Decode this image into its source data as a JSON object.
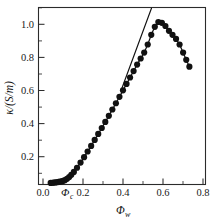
{
  "chart_data": {
    "type": "line",
    "title": "",
    "xlabel": "Φw",
    "ylabel": "κ/(S/m)",
    "xlabel_main": "Φ",
    "xlabel_subscript": "w",
    "ylabel_text": "κ/(S/m)",
    "xlim": [
      0.0,
      0.85
    ],
    "ylim": [
      0.0,
      1.1
    ],
    "x_ticks": [
      0.0,
      0.2,
      0.4,
      0.6,
      0.8
    ],
    "x_tick_labels": [
      "0.0",
      "0.2",
      "0.4",
      "0.6",
      "0.8"
    ],
    "y_ticks": [
      0.2,
      0.4,
      0.6,
      0.8,
      1.0
    ],
    "y_tick_labels": [
      "0.2",
      "0.4",
      "0.6",
      "0.8",
      "1.0"
    ],
    "x_minor_ticks": [
      0.1,
      0.3,
      0.5,
      0.7
    ],
    "y_minor_ticks": [
      0.1,
      0.3,
      0.5,
      0.7,
      0.9,
      1.1
    ],
    "grid": false,
    "legend": "none",
    "marker": "filled-circle",
    "marker_size": 3.1,
    "line_color": "#111111",
    "marker_color": "#111111",
    "axis_color": "#2b2b2b",
    "background": "#ffffff",
    "annotations": [
      {
        "name": "percolation-threshold",
        "text": "Φc",
        "text_main": "Φ",
        "text_subscript": "c",
        "x": 0.135,
        "y": 0.0,
        "description": "percolation threshold marker on x-axis"
      }
    ],
    "series": [
      {
        "name": "conductivity",
        "x": [
          0.062,
          0.07,
          0.078,
          0.086,
          0.094,
          0.102,
          0.11,
          0.118,
          0.126,
          0.134,
          0.145,
          0.156,
          0.167,
          0.18,
          0.196,
          0.214,
          0.232,
          0.25,
          0.268,
          0.286,
          0.304,
          0.322,
          0.34,
          0.358,
          0.376,
          0.394,
          0.412,
          0.43,
          0.448,
          0.466,
          0.484,
          0.502,
          0.52,
          0.538,
          0.556,
          0.574,
          0.592,
          0.61,
          0.628,
          0.646,
          0.664,
          0.682,
          0.7,
          0.718,
          0.736,
          0.752,
          0.768
        ],
        "y": [
          0.01,
          0.011,
          0.012,
          0.013,
          0.014,
          0.016,
          0.018,
          0.02,
          0.023,
          0.027,
          0.035,
          0.046,
          0.06,
          0.078,
          0.104,
          0.136,
          0.17,
          0.205,
          0.24,
          0.277,
          0.314,
          0.351,
          0.389,
          0.427,
          0.466,
          0.505,
          0.545,
          0.585,
          0.625,
          0.665,
          0.705,
          0.745,
          0.783,
          0.82,
          0.87,
          0.93,
          0.98,
          1.01,
          1.005,
          0.985,
          0.955,
          0.93,
          0.905,
          0.87,
          0.82,
          0.775,
          0.732
        ]
      }
    ],
    "tangent": {
      "name": "tangent-line",
      "description": "straight line fitted to the steep linear rise, extended above the peak",
      "x_start": 0.425,
      "y_start": 0.6,
      "x_end": 0.575,
      "y_end": 1.095
    },
    "peak": {
      "x": 0.61,
      "y": 1.01
    }
  }
}
